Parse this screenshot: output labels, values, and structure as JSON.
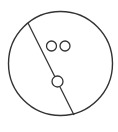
{
  "diagram": {
    "stroke_color": "#333333",
    "background": "#ffffff",
    "outer_circle": {
      "cx": 60.5,
      "cy": 63.5,
      "r": 52
    },
    "divider_line": {
      "x1": 28,
      "y1": 23,
      "x2": 74,
      "y2": 115
    },
    "small_circles": [
      {
        "cx": 51.5,
        "cy": 46,
        "r": 5
      },
      {
        "cx": 65,
        "cy": 46,
        "r": 5
      },
      {
        "cx": 57.5,
        "cy": 81.5,
        "r": 5.5
      }
    ]
  }
}
